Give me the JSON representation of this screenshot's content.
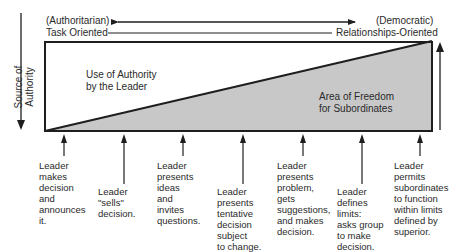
{
  "header": {
    "left_top": "(Authoritarian)",
    "left_bottom": "Task Oriented",
    "right_top": "(Democratic)",
    "right_bottom": "Relationships-Oriented"
  },
  "axis": {
    "vertical_label": "Source of\nAuthority"
  },
  "regions": {
    "leader_area": "Use of Authority\nby the Leader",
    "subordinate_area": "Area of Freedom\nfor Subordinates"
  },
  "colors": {
    "line": "#1e1e1e",
    "subordinate_fill": "#c8c8c8",
    "text": "#2a2a2a"
  },
  "behaviors": [
    {
      "label": "Leader\nmakes\ndecision\nand\nannounces\nit."
    },
    {
      "label": "Leader\n\"sells\"\ndecision."
    },
    {
      "label": "Leader\npresents\nideas\nand\ninvites\nquestions."
    },
    {
      "label": "Leader\npresents\ntentative\ndecision\nsubject\nto change."
    },
    {
      "label": "Leader\npresents\nproblem,\ngets\nsuggestions,\nand makes\ndecision."
    },
    {
      "label": "Leader\ndefines\nlimits:\nasks group\nto make\ndecision."
    },
    {
      "label": "Leader\npermits\nsubordinates\nto function\nwithin limits\ndefined by\nsuperior."
    }
  ]
}
